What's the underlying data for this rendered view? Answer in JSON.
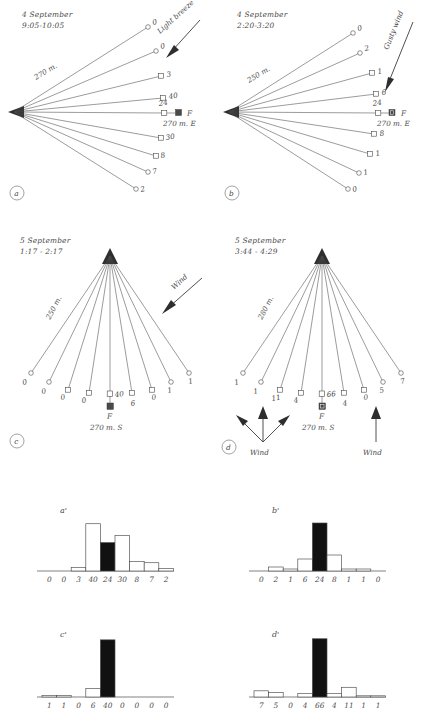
{
  "figure": {
    "panels": [
      {
        "id": "a",
        "label": "a",
        "date": "4 September",
        "time": "9:05-10:05",
        "distance_label": "270 m.",
        "home_label": "F",
        "home_distance": "270 m. E",
        "wind_label": "Light breeze",
        "center_value": "24",
        "values": [
          "0",
          "0",
          "3",
          "40",
          "24",
          "30",
          "8",
          "7",
          "2"
        ],
        "orientation": "fan-right"
      },
      {
        "id": "b",
        "label": "b",
        "date": "4 September",
        "time": "2:20-3:20",
        "distance_label": "250 m.",
        "home_label": "F",
        "home_distance": "270 m. E",
        "wind_label": "Gusty wind",
        "center_value": "24",
        "values": [
          "0",
          "2",
          "1",
          "6",
          "24",
          "8",
          "1",
          "1",
          "0"
        ],
        "orientation": "fan-right"
      },
      {
        "id": "c",
        "label": "c",
        "date": "5 September",
        "time": "1:17 - 2:17",
        "distance_label": "250 m.",
        "home_label": "F",
        "home_distance": "270 m. S",
        "wind_label": "Wind",
        "center_value": "40",
        "values": [
          "0",
          "0",
          "0",
          "0",
          "40",
          "6",
          "0",
          "1",
          "1"
        ],
        "orientation": "fan-down"
      },
      {
        "id": "d",
        "label": "d",
        "date": "5 September",
        "time": "3:44 - 4:29",
        "distance_label": "280 m.",
        "home_label": "F",
        "home_distance": "270 m. S",
        "wind_label": "Wind",
        "wind_label_2": "Wind",
        "center_value": "66",
        "values": [
          "1",
          "1",
          "11",
          "4",
          "66",
          "4",
          "0",
          "5",
          "7"
        ],
        "orientation": "fan-down"
      }
    ],
    "histograms": [
      {
        "id": "a-prime",
        "label": "a'",
        "source_panel": "a",
        "categories": [
          "0",
          "0",
          "3",
          "40",
          "24",
          "30",
          "8",
          "7",
          "2"
        ],
        "values": [
          0,
          0,
          3,
          40,
          24,
          30,
          8,
          7,
          2
        ],
        "highlight_index": 4
      },
      {
        "id": "b-prime",
        "label": "b'",
        "source_panel": "b",
        "categories": [
          "0",
          "2",
          "1",
          "6",
          "24",
          "8",
          "1",
          "1",
          "0"
        ],
        "values": [
          0,
          2,
          1,
          6,
          24,
          8,
          1,
          1,
          0
        ],
        "highlight_index": 4
      },
      {
        "id": "c-prime",
        "label": "c'",
        "source_panel": "c",
        "categories": [
          "1",
          "1",
          "0",
          "6",
          "40",
          "0",
          "0",
          "0",
          "0"
        ],
        "values": [
          1,
          1,
          0,
          6,
          40,
          0,
          0,
          0,
          0
        ],
        "highlight_index": 4
      },
      {
        "id": "d-prime",
        "label": "d'",
        "source_panel": "d",
        "categories": [
          "7",
          "5",
          "0",
          "4",
          "66",
          "4",
          "11",
          "1",
          "1"
        ],
        "values": [
          7,
          5,
          0,
          4,
          66,
          4,
          11,
          1,
          1
        ],
        "highlight_index": 4
      }
    ],
    "colors": {
      "ink": "#4a4a4a",
      "fill_black": "#111111",
      "paper": "#ffffff"
    }
  },
  "chart_data": {
    "type": "bar",
    "title": "",
    "charts": [
      {
        "name": "a'",
        "categories": [
          "0",
          "0",
          "3",
          "40",
          "24",
          "30",
          "8",
          "7",
          "2"
        ],
        "values": [
          0,
          0,
          3,
          40,
          24,
          30,
          8,
          7,
          2
        ],
        "highlight": 4
      },
      {
        "name": "b'",
        "categories": [
          "0",
          "2",
          "1",
          "6",
          "24",
          "8",
          "1",
          "1",
          "0"
        ],
        "values": [
          0,
          2,
          1,
          6,
          24,
          8,
          1,
          1,
          0
        ],
        "highlight": 4
      },
      {
        "name": "c'",
        "categories": [
          "1",
          "1",
          "0",
          "6",
          "40",
          "0",
          "0",
          "0",
          "0"
        ],
        "values": [
          1,
          1,
          0,
          6,
          40,
          0,
          0,
          0,
          0
        ],
        "highlight": 4
      },
      {
        "name": "d'",
        "categories": [
          "7",
          "5",
          "0",
          "4",
          "66",
          "4",
          "11",
          "1",
          "1"
        ],
        "values": [
          7,
          5,
          0,
          4,
          66,
          4,
          11,
          1,
          1
        ],
        "highlight": 4
      }
    ],
    "xlabel": "",
    "ylabel": "",
    "grid": false,
    "legend": "none"
  }
}
